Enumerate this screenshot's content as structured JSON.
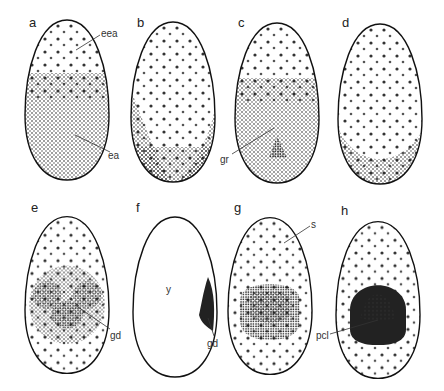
{
  "figure": {
    "panels": [
      {
        "id": "a",
        "label": "a",
        "annotations": [
          "eea",
          "ea"
        ]
      },
      {
        "id": "b",
        "label": "b",
        "annotations": []
      },
      {
        "id": "c",
        "label": "c",
        "annotations": [
          "gr"
        ]
      },
      {
        "id": "d",
        "label": "d",
        "annotations": []
      },
      {
        "id": "e",
        "label": "e",
        "annotations": [
          "gd"
        ]
      },
      {
        "id": "f",
        "label": "f",
        "annotations": [
          "y",
          "gd"
        ]
      },
      {
        "id": "g",
        "label": "g",
        "annotations": [
          "s"
        ]
      },
      {
        "id": "h",
        "label": "h",
        "annotations": [
          "pcl"
        ]
      }
    ]
  },
  "colors": {
    "ink": "#111111",
    "background": "#ffffff"
  }
}
